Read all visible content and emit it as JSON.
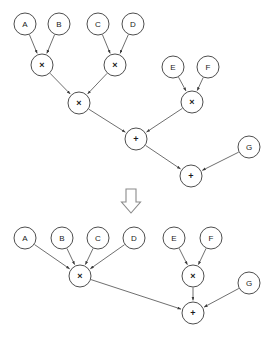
{
  "figure": {
    "background_color": "#ffffff",
    "node_stroke_color": "#3a3a3a",
    "edge_color": "#4a4a4a",
    "arrow_color": "#8a8a8a",
    "node_radius": 11,
    "transition_icon": "down-block-arrow"
  },
  "diagrams": [
    {
      "id": "before",
      "caption": "",
      "nodes": [
        {
          "id": "t_A",
          "label": "A",
          "kind": "operand",
          "x": 25,
          "y": 24
        },
        {
          "id": "t_B",
          "label": "B",
          "kind": "operand",
          "x": 59,
          "y": 24
        },
        {
          "id": "t_C",
          "label": "C",
          "kind": "operand",
          "x": 98,
          "y": 24
        },
        {
          "id": "t_D",
          "label": "D",
          "kind": "operand",
          "x": 133,
          "y": 24
        },
        {
          "id": "t_E",
          "label": "E",
          "kind": "operand",
          "x": 173,
          "y": 67
        },
        {
          "id": "t_F",
          "label": "F",
          "kind": "operand",
          "x": 208,
          "y": 67
        },
        {
          "id": "t_G",
          "label": "G",
          "kind": "operand",
          "x": 249,
          "y": 147
        },
        {
          "id": "t_M1",
          "label": "×",
          "kind": "multiply",
          "x": 42,
          "y": 65
        },
        {
          "id": "t_M2",
          "label": "×",
          "kind": "multiply",
          "x": 115,
          "y": 65
        },
        {
          "id": "t_M3",
          "label": "×",
          "kind": "multiply",
          "x": 79,
          "y": 103
        },
        {
          "id": "t_M4",
          "label": "×",
          "kind": "multiply",
          "x": 192,
          "y": 102
        },
        {
          "id": "t_P1",
          "label": "+",
          "kind": "add",
          "x": 136,
          "y": 139
        },
        {
          "id": "t_P2",
          "label": "+",
          "kind": "add",
          "x": 191,
          "y": 176
        }
      ],
      "edges": [
        {
          "from": "t_A",
          "to": "t_M1"
        },
        {
          "from": "t_B",
          "to": "t_M1"
        },
        {
          "from": "t_C",
          "to": "t_M2"
        },
        {
          "from": "t_D",
          "to": "t_M2"
        },
        {
          "from": "t_M1",
          "to": "t_M3"
        },
        {
          "from": "t_M2",
          "to": "t_M3"
        },
        {
          "from": "t_E",
          "to": "t_M4"
        },
        {
          "from": "t_F",
          "to": "t_M4"
        },
        {
          "from": "t_M3",
          "to": "t_P1"
        },
        {
          "from": "t_M4",
          "to": "t_P1"
        },
        {
          "from": "t_P1",
          "to": "t_P2"
        },
        {
          "from": "t_G",
          "to": "t_P2"
        }
      ]
    },
    {
      "id": "after",
      "caption": "",
      "nodes": [
        {
          "id": "b_A",
          "label": "A",
          "kind": "operand",
          "x": 25,
          "y": 238
        },
        {
          "id": "b_B",
          "label": "B",
          "kind": "operand",
          "x": 62,
          "y": 238
        },
        {
          "id": "b_C",
          "label": "C",
          "kind": "operand",
          "x": 98,
          "y": 238
        },
        {
          "id": "b_D",
          "label": "D",
          "kind": "operand",
          "x": 134,
          "y": 238
        },
        {
          "id": "b_E",
          "label": "E",
          "kind": "operand",
          "x": 174,
          "y": 238
        },
        {
          "id": "b_F",
          "label": "F",
          "kind": "operand",
          "x": 211,
          "y": 238
        },
        {
          "id": "b_G",
          "label": "G",
          "kind": "operand",
          "x": 249,
          "y": 283
        },
        {
          "id": "b_M1",
          "label": "×",
          "kind": "multiply",
          "x": 80,
          "y": 276
        },
        {
          "id": "b_M2",
          "label": "×",
          "kind": "multiply",
          "x": 193,
          "y": 276
        },
        {
          "id": "b_P1",
          "label": "+",
          "kind": "add",
          "x": 193,
          "y": 313
        }
      ],
      "edges": [
        {
          "from": "b_A",
          "to": "b_M1"
        },
        {
          "from": "b_B",
          "to": "b_M1"
        },
        {
          "from": "b_C",
          "to": "b_M1"
        },
        {
          "from": "b_D",
          "to": "b_M1"
        },
        {
          "from": "b_E",
          "to": "b_M2"
        },
        {
          "from": "b_F",
          "to": "b_M2"
        },
        {
          "from": "b_M1",
          "to": "b_P1"
        },
        {
          "from": "b_M2",
          "to": "b_P1"
        },
        {
          "from": "b_G",
          "to": "b_P1"
        }
      ]
    }
  ],
  "transition": {
    "icon_name": "down-block-arrow",
    "x": 131,
    "y": 201,
    "label": ""
  }
}
